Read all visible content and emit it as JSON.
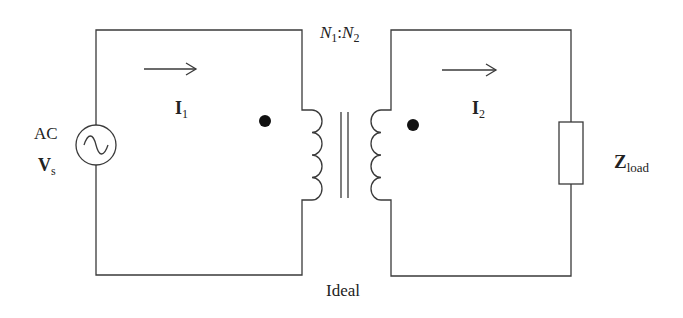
{
  "diagram": {
    "type": "ideal transformer circuit",
    "source": {
      "type_label": "AC",
      "symbol": "V",
      "subscript": "s"
    },
    "primary_current": {
      "symbol": "I",
      "subscript": "1"
    },
    "secondary_current": {
      "symbol": "I",
      "subscript": "2"
    },
    "turns_ratio": {
      "n1": "N",
      "n1_sub": "1",
      "sep": ":",
      "n2": "N",
      "n2_sub": "2"
    },
    "load": {
      "symbol": "Z",
      "subscript": "load"
    },
    "transformer_label": "Ideal",
    "colors": {
      "wire": "#3a3a3a",
      "background": "#ffffff"
    }
  }
}
